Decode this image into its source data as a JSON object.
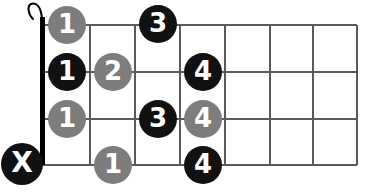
{
  "diagram": {
    "type": "guitar-chord-fretboard",
    "orientation": "horizontal-strings",
    "colors": {
      "black": "#111111",
      "gray": "#7d7d7d",
      "line": "#5a5a5a",
      "nut": "#000000",
      "background": "#ffffff",
      "label": "#ffffff"
    },
    "geometry": {
      "width": 372,
      "height": 194,
      "nut_x": 42,
      "grid_left": 42,
      "grid_right": 357,
      "grid_top": 25,
      "grid_bottom": 165,
      "fret_lines_x": [
        42,
        90,
        135,
        180,
        225,
        270,
        313,
        357
      ],
      "string_lines_y": [
        25,
        72,
        119,
        165
      ],
      "nut_thickness": 5,
      "line_thickness": 2
    },
    "nut": {
      "label": "nut",
      "has_hook": true
    },
    "markers": [
      {
        "label": "1",
        "color": "gray",
        "x": 67,
        "y": 25,
        "kind": "finger"
      },
      {
        "label": "3",
        "color": "black",
        "x": 158,
        "y": 24,
        "kind": "finger"
      },
      {
        "label": "1",
        "color": "black",
        "x": 67,
        "y": 72,
        "kind": "finger"
      },
      {
        "label": "2",
        "color": "gray",
        "x": 113,
        "y": 72,
        "kind": "finger"
      },
      {
        "label": "4",
        "color": "black",
        "x": 203,
        "y": 72,
        "kind": "finger"
      },
      {
        "label": "1",
        "color": "gray",
        "x": 67,
        "y": 119,
        "kind": "finger"
      },
      {
        "label": "3",
        "color": "black",
        "x": 158,
        "y": 119,
        "kind": "finger"
      },
      {
        "label": "4",
        "color": "gray",
        "x": 203,
        "y": 119,
        "kind": "finger"
      },
      {
        "label": "1",
        "color": "gray",
        "x": 113,
        "y": 165,
        "kind": "finger"
      },
      {
        "label": "4",
        "color": "black",
        "x": 203,
        "y": 165,
        "kind": "finger"
      },
      {
        "label": "X",
        "color": "black",
        "x": 22,
        "y": 164,
        "kind": "mute"
      }
    ]
  }
}
